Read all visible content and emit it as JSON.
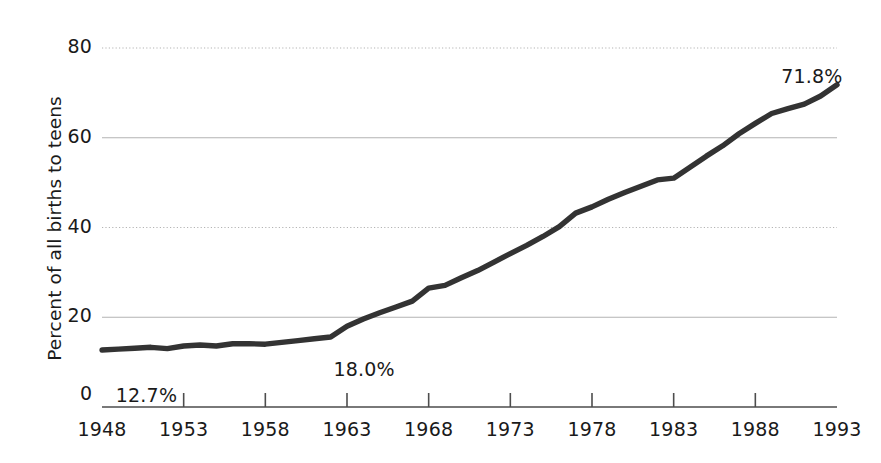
{
  "chart_data": {
    "type": "line",
    "title": "",
    "subtitle": "",
    "xlabel": "",
    "ylabel": "Percent of all births to teens",
    "xlim": [
      1948,
      1993
    ],
    "ylim": [
      0,
      80
    ],
    "grid": true,
    "legend": false,
    "legend_position": "none",
    "xticks": [
      "1948",
      "1953",
      "1958",
      "1963",
      "1968",
      "1973",
      "1978",
      "1983",
      "1988",
      "1993"
    ],
    "yticks": [
      "20",
      "40",
      "60",
      "80"
    ],
    "origin_tick": "0",
    "line_color": "#333333",
    "grid_color": "#b4b4b4",
    "axis_color": "#4d4d4d",
    "annotations": [
      {
        "id": "start-value",
        "text": "12.7%",
        "x": 1948.6,
        "y": 12.7,
        "dx": 4,
        "dy": 34
      },
      {
        "id": "mid-value",
        "text": "18.0%",
        "x": 1961.8,
        "y": 18.0,
        "dx": 6,
        "dy": 32
      },
      {
        "id": "end-value",
        "text": "71.8%",
        "x": 1990.2,
        "y": 71.8,
        "dx": -10,
        "dy": -20
      }
    ],
    "x": [
      1948,
      1949,
      1950,
      1951,
      1952,
      1953,
      1954,
      1955,
      1956,
      1957,
      1958,
      1959,
      1960,
      1961,
      1962,
      1963,
      1964,
      1965,
      1966,
      1967,
      1968,
      1969,
      1970,
      1971,
      1972,
      1973,
      1974,
      1975,
      1976,
      1977,
      1978,
      1979,
      1980,
      1981,
      1982,
      1983,
      1984,
      1985,
      1986,
      1987,
      1988,
      1989,
      1990,
      1991,
      1992,
      1993
    ],
    "values": [
      12.7,
      12.9,
      13.1,
      13.3,
      13.0,
      13.6,
      13.8,
      13.6,
      14.1,
      14.1,
      14.0,
      14.4,
      14.8,
      15.2,
      15.6,
      18.0,
      19.6,
      21.0,
      22.3,
      23.6,
      26.5,
      27.1,
      28.8,
      30.4,
      32.3,
      34.2,
      36.0,
      38.0,
      40.2,
      43.2,
      44.6,
      46.3,
      47.8,
      49.2,
      50.6,
      51.0,
      53.4,
      55.9,
      58.2,
      60.9,
      63.2,
      65.4,
      66.5,
      67.5,
      69.3,
      71.8
    ],
    "series": [
      {
        "name": "Percent of all births to teens",
        "values": [
          12.7,
          12.9,
          13.1,
          13.3,
          13.0,
          13.6,
          13.8,
          13.6,
          14.1,
          14.1,
          14.0,
          14.4,
          14.8,
          15.2,
          15.6,
          18.0,
          19.6,
          21.0,
          22.3,
          23.6,
          26.5,
          27.1,
          28.8,
          30.4,
          32.3,
          34.2,
          36.0,
          38.0,
          40.2,
          43.2,
          44.6,
          46.3,
          47.8,
          49.2,
          50.6,
          51.0,
          53.4,
          55.9,
          58.2,
          60.9,
          63.2,
          65.4,
          66.5,
          67.5,
          69.3,
          71.8
        ]
      }
    ]
  }
}
